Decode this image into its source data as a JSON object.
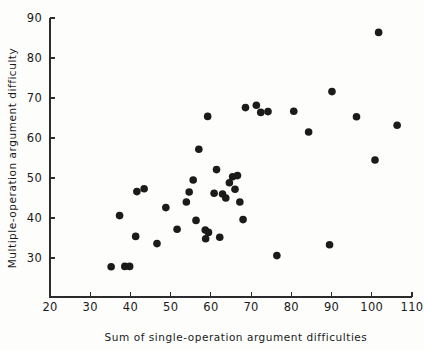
{
  "chart_data": {
    "type": "scatter",
    "title": "",
    "xlabel": "Sum of single-operation argument difficulties",
    "ylabel": "Multiple-operation argument difficulty",
    "xlim": [
      20,
      110
    ],
    "ylim": [
      20.25,
      90
    ],
    "xticks": [
      20,
      30,
      40,
      50,
      60,
      70,
      80,
      90,
      100,
      110
    ],
    "yticks": [
      30,
      40,
      50,
      60,
      70,
      80,
      90
    ],
    "xtick_labels": [
      "20",
      "30",
      "40",
      "50",
      "60",
      "70",
      "80",
      "90",
      "100",
      "110"
    ],
    "ytick_labels": [
      "30",
      "40",
      "50",
      "60",
      "70",
      "80",
      "90"
    ],
    "grid": false,
    "legend": null,
    "marker": "filled-circle",
    "marker_color": "#1b1b1b",
    "marker_size": 5.2,
    "points": [
      {
        "x": 35.2,
        "y": 27.8
      },
      {
        "x": 38.6,
        "y": 27.9
      },
      {
        "x": 39.8,
        "y": 27.9
      },
      {
        "x": 37.3,
        "y": 40.6
      },
      {
        "x": 41.6,
        "y": 46.6
      },
      {
        "x": 41.3,
        "y": 35.4
      },
      {
        "x": 43.4,
        "y": 47.3
      },
      {
        "x": 46.6,
        "y": 33.6
      },
      {
        "x": 48.8,
        "y": 42.6
      },
      {
        "x": 51.6,
        "y": 37.2
      },
      {
        "x": 53.9,
        "y": 44.0
      },
      {
        "x": 54.6,
        "y": 46.5
      },
      {
        "x": 55.6,
        "y": 49.5
      },
      {
        "x": 56.3,
        "y": 39.4
      },
      {
        "x": 57.0,
        "y": 57.2
      },
      {
        "x": 58.6,
        "y": 37.0
      },
      {
        "x": 58.7,
        "y": 34.8
      },
      {
        "x": 59.2,
        "y": 65.4
      },
      {
        "x": 59.4,
        "y": 36.4
      },
      {
        "x": 60.8,
        "y": 46.2
      },
      {
        "x": 61.4,
        "y": 52.1
      },
      {
        "x": 62.2,
        "y": 35.2
      },
      {
        "x": 62.9,
        "y": 46.0
      },
      {
        "x": 63.7,
        "y": 45.0
      },
      {
        "x": 64.6,
        "y": 48.8
      },
      {
        "x": 65.4,
        "y": 50.3
      },
      {
        "x": 66.0,
        "y": 47.2
      },
      {
        "x": 66.6,
        "y": 50.6
      },
      {
        "x": 67.2,
        "y": 44.0
      },
      {
        "x": 68.0,
        "y": 39.6
      },
      {
        "x": 68.6,
        "y": 67.6
      },
      {
        "x": 71.3,
        "y": 68.2
      },
      {
        "x": 72.4,
        "y": 66.4
      },
      {
        "x": 74.2,
        "y": 66.6
      },
      {
        "x": 76.4,
        "y": 30.6
      },
      {
        "x": 80.6,
        "y": 66.7
      },
      {
        "x": 84.3,
        "y": 61.5
      },
      {
        "x": 89.5,
        "y": 33.3
      },
      {
        "x": 90.1,
        "y": 71.6
      },
      {
        "x": 96.2,
        "y": 65.3
      },
      {
        "x": 100.8,
        "y": 54.5
      },
      {
        "x": 101.7,
        "y": 86.4
      },
      {
        "x": 106.3,
        "y": 63.2
      }
    ]
  },
  "axes": {
    "y_title": "Multiple-operation argument difficulty",
    "x_title": "Sum of single-operation argument difficulties"
  }
}
